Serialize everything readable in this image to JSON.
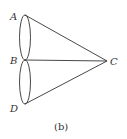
{
  "figure": {
    "caption": "(b)",
    "points": {
      "A": {
        "label": "A",
        "x": 25,
        "y": 15
      },
      "B": {
        "label": "B",
        "x": 25,
        "y": 60
      },
      "C": {
        "label": "C",
        "x": 107,
        "y": 61
      },
      "D": {
        "label": "D",
        "x": 25,
        "y": 104
      }
    },
    "segments": [
      "AC",
      "BC",
      "DC"
    ],
    "ellipses": [
      "AB",
      "BD"
    ],
    "stroke_color": "#333333"
  }
}
